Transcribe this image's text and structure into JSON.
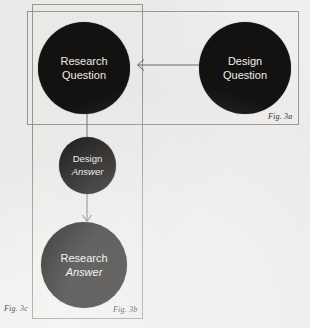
{
  "figure": {
    "background_color": "#f1efed",
    "node_color": "#141210",
    "node_text_color": "#f2f0ee",
    "line_color": "#6b6966",
    "box_border_color": "#9a9894"
  },
  "boxes": [
    {
      "id": "fig3a",
      "label": "Fig. 3a"
    },
    {
      "id": "fig3b",
      "label": "Fig. 3b"
    }
  ],
  "outside_label": {
    "id": "fig3c",
    "label": "Fig. 3c"
  },
  "nodes": [
    {
      "id": "research-question",
      "line1": "Research",
      "line2": "Question",
      "line1_style": "regular",
      "line2_style": "regular"
    },
    {
      "id": "design-question",
      "line1": "Design",
      "line2": "Question",
      "line1_style": "regular",
      "line2_style": "regular"
    },
    {
      "id": "design-answer",
      "line1": "Design",
      "line2": "Answer",
      "line1_style": "regular",
      "line2_style": "italic"
    },
    {
      "id": "research-answer",
      "line1": "Research",
      "line2": "Answer",
      "line1_style": "regular",
      "line2_style": "italic"
    }
  ],
  "connectors": [
    {
      "id": "design-question-to-research-question",
      "direction": "left"
    },
    {
      "id": "research-question-to-design-answer",
      "direction": "down"
    },
    {
      "id": "design-answer-to-research-answer",
      "direction": "down"
    }
  ]
}
